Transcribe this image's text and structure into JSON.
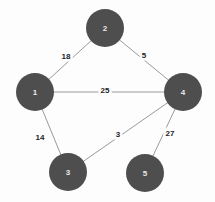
{
  "chart_data": {
    "type": "diagram",
    "diagram_kind": "weighted-undirected-graph",
    "title": "",
    "background_color": "#fdfdfd",
    "node_color": "#4e4e4e",
    "node_label_color": "#e9e9e9",
    "edge_color": "#9a9a9a",
    "edge_label_color": "#1d1d1d",
    "nodes": [
      {
        "id": "1",
        "label": "1",
        "cx": 35,
        "cy": 92,
        "r": 19
      },
      {
        "id": "2",
        "label": "2",
        "cx": 105,
        "cy": 28,
        "r": 19
      },
      {
        "id": "3",
        "label": "3",
        "cx": 68,
        "cy": 172,
        "r": 19
      },
      {
        "id": "4",
        "label": "4",
        "cx": 183,
        "cy": 92,
        "r": 19
      },
      {
        "id": "5",
        "label": "5",
        "cx": 145,
        "cy": 173,
        "r": 19
      }
    ],
    "edges": [
      {
        "source": "1",
        "target": "2",
        "weight": 18,
        "label": "18",
        "lx": 66,
        "ly": 56
      },
      {
        "source": "2",
        "target": "4",
        "weight": 5,
        "label": "5",
        "lx": 144,
        "ly": 55
      },
      {
        "source": "1",
        "target": "4",
        "weight": 25,
        "label": "25",
        "lx": 105,
        "ly": 90
      },
      {
        "source": "1",
        "target": "3",
        "weight": 14,
        "label": "14",
        "lx": 40,
        "ly": 137
      },
      {
        "source": "3",
        "target": "4",
        "weight": 3,
        "label": "3",
        "lx": 118,
        "ly": 134
      },
      {
        "source": "4",
        "target": "5",
        "weight": 27,
        "label": "27",
        "lx": 170,
        "ly": 133
      }
    ]
  }
}
